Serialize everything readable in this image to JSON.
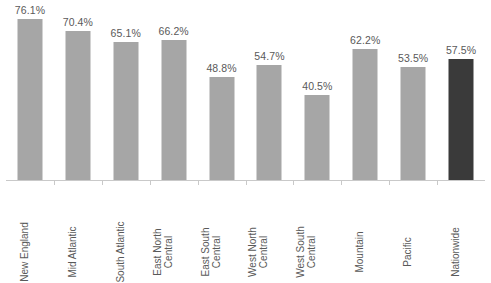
{
  "chart_data": {
    "type": "bar",
    "title": "",
    "subtitle": "",
    "xlabel": "",
    "ylabel": "",
    "ylim": [
      0,
      85
    ],
    "grid": false,
    "legend": false,
    "value_suffix": "%",
    "categories": [
      "New England",
      "Mid Atlantic",
      "South Atlantic",
      "East North Central",
      "East South Central",
      "West North Central",
      "West South Central",
      "Mountain",
      "Pacific",
      "Nationwide"
    ],
    "values": [
      76.1,
      70.4,
      65.1,
      66.2,
      48.8,
      54.7,
      40.5,
      62.2,
      53.5,
      57.5
    ],
    "data_labels": [
      "76.1%",
      "70.4%",
      "65.1%",
      "66.2%",
      "48.8%",
      "54.7%",
      "40.5%",
      "62.2%",
      "53.5%",
      "57.5%"
    ],
    "bars": [
      {
        "category": "New England",
        "label_line1": "New England",
        "label_line2": "",
        "value": 76.1,
        "data_label": "76.1%",
        "color": "#a6a6a6",
        "highlight": false
      },
      {
        "category": "Mid Atlantic",
        "label_line1": "Mid Atlantic",
        "label_line2": "",
        "value": 70.4,
        "data_label": "70.4%",
        "color": "#a6a6a6",
        "highlight": false
      },
      {
        "category": "South Atlantic",
        "label_line1": "South Atlantic",
        "label_line2": "",
        "value": 65.1,
        "data_label": "65.1%",
        "color": "#a6a6a6",
        "highlight": false
      },
      {
        "category": "East North Central",
        "label_line1": "East North",
        "label_line2": "Central",
        "value": 66.2,
        "data_label": "66.2%",
        "color": "#a6a6a6",
        "highlight": false
      },
      {
        "category": "East South Central",
        "label_line1": "East South",
        "label_line2": "Central",
        "value": 48.8,
        "data_label": "48.8%",
        "color": "#a6a6a6",
        "highlight": false
      },
      {
        "category": "West North Central",
        "label_line1": "West North",
        "label_line2": "Central",
        "value": 54.7,
        "data_label": "54.7%",
        "color": "#a6a6a6",
        "highlight": false
      },
      {
        "category": "West South Central",
        "label_line1": "West South",
        "label_line2": "Central",
        "value": 40.5,
        "data_label": "40.5%",
        "color": "#a6a6a6",
        "highlight": false
      },
      {
        "category": "Mountain",
        "label_line1": "Mountain",
        "label_line2": "",
        "value": 62.2,
        "data_label": "62.2%",
        "color": "#a6a6a6",
        "highlight": false
      },
      {
        "category": "Pacific",
        "label_line1": "Pacific",
        "label_line2": "",
        "value": 53.5,
        "data_label": "53.5%",
        "color": "#a6a6a6",
        "highlight": false
      },
      {
        "category": "Nationwide",
        "label_line1": "Nationwide",
        "label_line2": "",
        "value": 57.5,
        "data_label": "57.5%",
        "color": "#3a3a3a",
        "highlight": true
      }
    ]
  },
  "colors": {
    "bar": "#a6a6a6",
    "bar_highlight": "#3a3a3a",
    "axis": "#c9c9c9",
    "text": "#595959",
    "background": "#ffffff"
  }
}
